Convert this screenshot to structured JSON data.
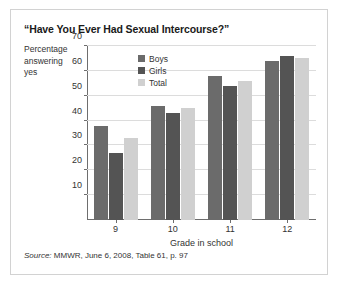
{
  "figure": {
    "title": "“Have You Ever Had Sexual Intercourse?”",
    "ylabel_line1": "Percentage",
    "ylabel_line2": "answering",
    "ylabel_line3": "yes",
    "source_word": "Source:",
    "source_text": " MMWR, June 6, 2008, Table 61, p. 97"
  },
  "colors": {
    "boys": "#6b6b6b",
    "girls": "#545454",
    "total": "#d0d0d0",
    "axis": "#6e6e6e",
    "grid": "#dcdcdc",
    "border": "#d2d2d2",
    "text": "#333333"
  },
  "chart_data": {
    "type": "bar",
    "title": "“Have You Ever Had Sexual Intercourse?”",
    "xlabel": "Grade in school",
    "ylabel": "Percentage answering yes",
    "categories": [
      "9",
      "10",
      "11",
      "12"
    ],
    "series": [
      {
        "name": "Boys",
        "values": [
          38,
          46,
          58,
          64
        ]
      },
      {
        "name": "Girls",
        "values": [
          27,
          43,
          54,
          66
        ]
      },
      {
        "name": "Total",
        "values": [
          33,
          45,
          56,
          65
        ]
      }
    ],
    "ylim": [
      0,
      70
    ],
    "yticks": [
      10,
      20,
      30,
      40,
      50,
      60,
      70
    ],
    "grid": true,
    "legend_position": "inside-top-left"
  }
}
